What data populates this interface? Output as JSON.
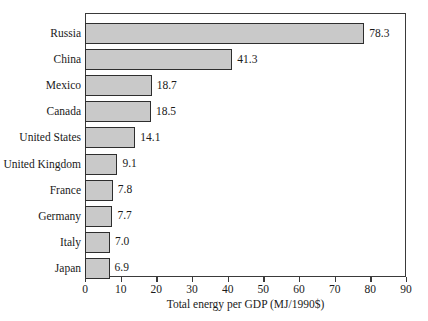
{
  "chart_data": {
    "type": "bar",
    "orientation": "horizontal",
    "title": "",
    "xlabel": "Total energy per GDP (MJ/1990$)",
    "ylabel": "",
    "categories": [
      "Russia",
      "China",
      "Mexico",
      "Canada",
      "United States",
      "United Kingdom",
      "France",
      "Germany",
      "Italy",
      "Japan"
    ],
    "values": [
      78.3,
      41.3,
      18.7,
      18.5,
      14.1,
      9.1,
      7.8,
      7.7,
      7.0,
      6.9
    ],
    "value_labels": [
      "78.3",
      "41.3",
      "18.7",
      "18.5",
      "14.1",
      "9.1",
      "7.8",
      "7.7",
      "7.0",
      "6.9"
    ],
    "xlim": [
      0,
      90
    ],
    "xticks": [
      0,
      10,
      20,
      30,
      40,
      50,
      60,
      70,
      80,
      90
    ],
    "xtick_labels": [
      "0",
      "10",
      "20",
      "30",
      "40",
      "50",
      "60",
      "70",
      "80",
      "90"
    ],
    "grid": false,
    "legend": null,
    "bar_fill_color": "#c9c9c9",
    "bar_edge_color": "#2e2e2e",
    "frame_color": "#3a3a3a",
    "background_color": "#ffffff"
  }
}
